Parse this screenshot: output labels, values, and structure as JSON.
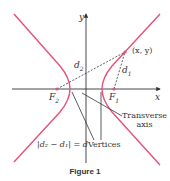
{
  "figure": {
    "caption": "Figure 1",
    "curve_color": "#e8517a",
    "axis_color": "#333333",
    "dash_color": "#333333"
  },
  "labels": {
    "y_axis": "y",
    "x_axis": "x",
    "point": "(x, y)",
    "d1": "d",
    "d1_sub": "1",
    "d2": "d",
    "d2_sub": "2",
    "focus_left": "F",
    "focus_left_sub": "2",
    "focus_right": "F",
    "focus_right_sub": "1",
    "transverse_line1": "Transverse",
    "transverse_line2": "axis",
    "vertices": "Vertices",
    "equation": "|d₂ − d₁| = d"
  }
}
